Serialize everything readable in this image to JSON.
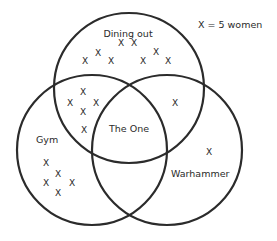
{
  "diagram": {
    "type": "venn",
    "legend": "X = 5 women",
    "marker_glyph": "X",
    "marker_value": 5,
    "stroke_color": "#2b2b2b",
    "sets": [
      {
        "id": "dining",
        "label": "Dining out",
        "cx": 129,
        "cy": 88,
        "r": 75
      },
      {
        "id": "gym",
        "label": "Gym",
        "cx": 92,
        "cy": 150,
        "r": 75
      },
      {
        "id": "warhammer",
        "label": "Warhammer",
        "cx": 167,
        "cy": 150,
        "r": 75
      }
    ],
    "center_label": "The One",
    "label_positions": {
      "dining": {
        "x": 128,
        "y": 37,
        "anchor": "middle"
      },
      "gym": {
        "x": 36,
        "y": 143,
        "anchor": "start"
      },
      "warhammer": {
        "x": 171,
        "y": 177,
        "anchor": "start"
      },
      "center": {
        "x": 129,
        "y": 132,
        "anchor": "middle"
      },
      "legend": {
        "x": 198,
        "y": 28,
        "anchor": "start"
      }
    },
    "regions": [
      {
        "name": "Dining out only",
        "count_marks": 8,
        "women": 40,
        "marks": [
          [
            121,
            43
          ],
          [
            134,
            43
          ],
          [
            98,
            53
          ],
          [
            156,
            52
          ],
          [
            85,
            61
          ],
          [
            111,
            61
          ],
          [
            143,
            61
          ],
          [
            168,
            61
          ]
        ]
      },
      {
        "name": "Dining out and Gym",
        "count_marks": 5,
        "women": 25,
        "marks": [
          [
            83,
            92
          ],
          [
            70,
            103
          ],
          [
            96,
            103
          ],
          [
            83,
            112
          ],
          [
            84,
            130
          ]
        ]
      },
      {
        "name": "Dining out and Warhammer",
        "count_marks": 1,
        "women": 5,
        "marks": [
          [
            175,
            103
          ]
        ]
      },
      {
        "name": "Gym only",
        "count_marks": 5,
        "women": 25,
        "marks": [
          [
            46,
            163
          ],
          [
            58,
            174
          ],
          [
            46,
            183
          ],
          [
            72,
            183
          ],
          [
            58,
            193
          ]
        ]
      },
      {
        "name": "Warhammer only",
        "count_marks": 1,
        "women": 5,
        "marks": [
          [
            209,
            152
          ]
        ]
      },
      {
        "name": "Gym and Warhammer",
        "count_marks": 0,
        "women": 0,
        "marks": []
      },
      {
        "name": "The One (all three)",
        "count_marks": 0,
        "women": 0,
        "marks": []
      }
    ]
  }
}
